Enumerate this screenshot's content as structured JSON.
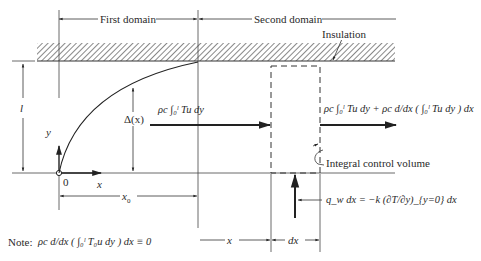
{
  "diagram": {
    "type": "boundary-layer thermal integral control volume",
    "labels": {
      "first_domain": "First domain",
      "second_domain": "Second domain",
      "insulation": "Insulation",
      "thickness": "l",
      "y_axis": "y",
      "x_axis": "x",
      "origin": "0",
      "delta": "Δ(x)",
      "x0": "x",
      "x0_sub": "0",
      "x_dim": "x",
      "dx_dim": "dx",
      "control_volume": "Integral control volume"
    },
    "equations": {
      "inflow": "ρc ∫₀ˡ Tu dy",
      "outflow": "ρc ∫₀ˡ Tu dy + ρc d/dx ( ∫₀ˡ Tu dy ) dx",
      "wall_flux": "q_w dx = −k (∂T/∂y)_{y=0} dx",
      "note_label": "Note:",
      "note": "ρc d/dx ( ∫₀ˡ T₀u dy ) dx ≡ 0"
    },
    "colors": {
      "line": "#333333",
      "hatch": "#555555",
      "background": "#ffffff"
    }
  }
}
